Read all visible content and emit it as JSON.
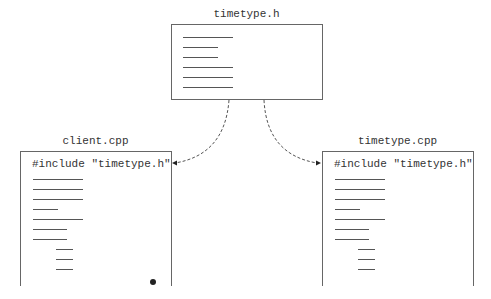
{
  "header_file": {
    "title": "timetype.h",
    "line_widths": [
      50,
      35,
      35,
      50,
      50,
      50
    ]
  },
  "client_file": {
    "title": "client.cpp",
    "include_text": "#include \"timetype.h\"",
    "line_widths": [
      50,
      50,
      50,
      25,
      50,
      34,
      34,
      17,
      17,
      17
    ],
    "line_indents": [
      0,
      0,
      0,
      0,
      0,
      0,
      0,
      23,
      23,
      23
    ],
    "marker": "dot"
  },
  "impl_file": {
    "title": "timetype.cpp",
    "include_text": "#include \"timetype.h\"",
    "line_widths": [
      50,
      50,
      50,
      25,
      50,
      34,
      34,
      17,
      17,
      17
    ],
    "line_indents": [
      0,
      0,
      0,
      0,
      0,
      0,
      0,
      23,
      23,
      23
    ]
  },
  "arrows": [
    {
      "from": "timetype.h",
      "to": "client.cpp",
      "style": "dashed"
    },
    {
      "from": "timetype.h",
      "to": "timetype.cpp",
      "style": "dashed"
    }
  ],
  "colors": {
    "stroke": "#666666",
    "text": "#333333",
    "background": "#ffffff"
  }
}
